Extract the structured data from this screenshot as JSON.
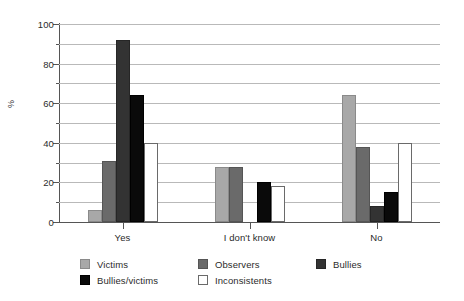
{
  "chart_data": {
    "type": "bar",
    "title": "",
    "xlabel": "",
    "ylabel": "%",
    "ylim": [
      0,
      100
    ],
    "ytick_values": [
      0,
      20,
      40,
      60,
      80,
      100
    ],
    "ytick_labels": [
      "0",
      "20",
      "40",
      "60",
      "80",
      "100"
    ],
    "yminor_values": [
      10,
      30,
      50,
      70,
      90
    ],
    "grid": true,
    "grid_axis": "y",
    "legend_position": "bottom",
    "categories": [
      "Yes",
      "I don't know",
      "No"
    ],
    "series": [
      {
        "name": "Victims",
        "color": "#a8a8a8",
        "values": [
          6,
          28,
          64
        ]
      },
      {
        "name": "Observers",
        "color": "#6a6a6a",
        "values": [
          31,
          28,
          38
        ]
      },
      {
        "name": "Bullies",
        "color": "#333333",
        "values": [
          92,
          0,
          8
        ]
      },
      {
        "name": "Bullies/victims",
        "color": "#0a0a0a",
        "values": [
          64,
          20,
          15
        ]
      },
      {
        "name": "Inconsistents",
        "color": "#ffffff",
        "values": [
          40,
          18,
          40
        ]
      }
    ]
  },
  "legend": {
    "rows": [
      [
        {
          "label": "Victims",
          "key": "victims"
        },
        {
          "label": "Observers",
          "key": "observers"
        },
        {
          "label": "Bullies",
          "key": "bullies"
        }
      ],
      [
        {
          "label": "Bullies/victims",
          "key": "bulliesvictims"
        },
        {
          "label": "Inconsistents",
          "key": "inconsistents"
        }
      ]
    ]
  }
}
